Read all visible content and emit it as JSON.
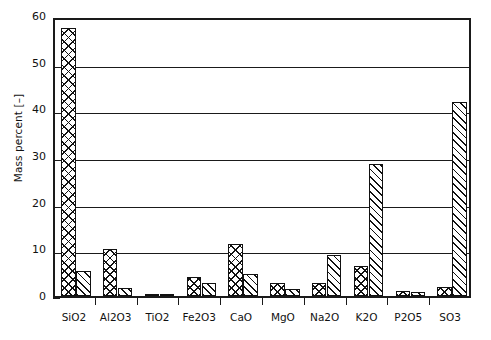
{
  "chart_data": {
    "type": "bar",
    "title": "",
    "xlabel": "",
    "ylabel": "Mass percent [–]",
    "ylim": [
      0,
      60
    ],
    "ytick_step": 10,
    "yminor_step": 2,
    "grid": true,
    "legend": "none",
    "categories": [
      "SiO2",
      "Al2O3",
      "TiO2",
      "Fe2O3",
      "CaO",
      "MgO",
      "Na2O",
      "K2O",
      "P2O5",
      "SO3"
    ],
    "yticks": [
      "0",
      "10",
      "20",
      "30",
      "40",
      "50",
      "60"
    ],
    "series": [
      {
        "name": "Series 1",
        "pattern": "cross-hatch",
        "values": [
          57.5,
          10.1,
          0.5,
          4.0,
          11.2,
          2.8,
          2.8,
          6.5,
          1.0,
          2.0
        ]
      },
      {
        "name": "Series 2",
        "pattern": "diagonal-hatch",
        "values": [
          5.3,
          1.7,
          0.2,
          2.7,
          4.7,
          1.4,
          8.8,
          28.2,
          0.8,
          41.5
        ]
      }
    ]
  },
  "colors": {
    "axis": "#1a1a1a",
    "grid": "#1a1a1a",
    "bar_edge": "#111111",
    "background": "#ffffff"
  }
}
